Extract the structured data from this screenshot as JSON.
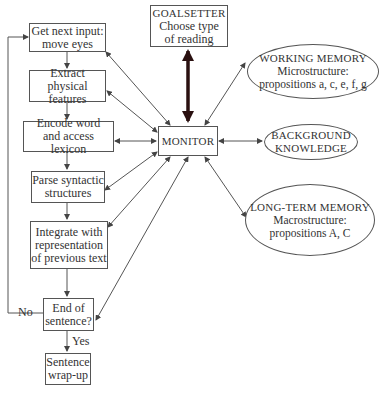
{
  "diagram": {
    "process_boxes": [
      {
        "id": "get-next-input",
        "line1": "Get next input:",
        "line2": "move eyes"
      },
      {
        "id": "extract-physical",
        "line1": "Extract physical",
        "line2": "features"
      },
      {
        "id": "encode-word",
        "line1": "Encode word",
        "line2": "and access lexicon"
      },
      {
        "id": "parse-syntactic",
        "line1": "Parse syntactic",
        "line2": "structures"
      },
      {
        "id": "integrate",
        "line1": "Integrate with",
        "line2": "representation",
        "line3": "of previous text"
      },
      {
        "id": "end-of-sentence",
        "line1": "End of",
        "line2": "sentence?"
      },
      {
        "id": "sentence-wrap-up",
        "line1": "Sentence",
        "line2": "wrap-up"
      }
    ],
    "goalsetter": {
      "title": "GOALSETTER",
      "line1": "Choose type",
      "line2": "of reading"
    },
    "monitor": {
      "title": "MONITOR"
    },
    "working_memory": {
      "title": "WORKING MEMORY",
      "line1": "Microstructure:",
      "line2": "propositions a, c, e, f, g"
    },
    "background_knowledge": {
      "line1": "BACKGROUND",
      "line2": "KNOWLEDGE"
    },
    "long_term_memory": {
      "title": "LONG-TERM MEMORY",
      "line1": "Macrostructure:",
      "line2": "propositions A, C"
    },
    "edge_labels": {
      "no": "No",
      "yes": "Yes"
    },
    "colors": {
      "line": "#555555",
      "thick_arrow": "#2a1010",
      "text": "#333333"
    }
  }
}
